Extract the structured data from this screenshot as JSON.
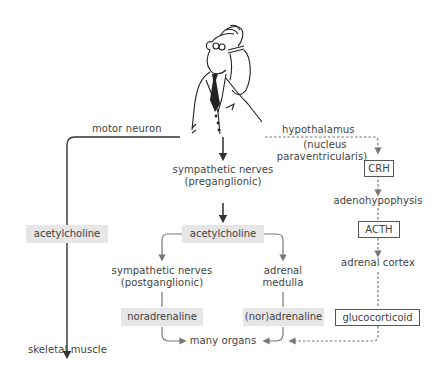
{
  "diagram": {
    "figure": "stressed-man-scratching-head-icon",
    "left_pathway": {
      "nerve_label": "motor neuron",
      "transmitter": "acetylcholine",
      "target": "skeletal muscle"
    },
    "middle_pathway": {
      "nerve_label_line1": "sympathetic nerves",
      "nerve_label_line2": "(preganglionic)",
      "transmitter": "acetylcholine",
      "branch_left": {
        "label_line1": "sympathetic nerves",
        "label_line2": "(postganglionic)",
        "transmitter": "noradrenaline"
      },
      "branch_right": {
        "label_line1": "adrenal",
        "label_line2": "medulla",
        "transmitter": "(nor)adrenaline"
      },
      "target": "many organs"
    },
    "right_pathway": {
      "origin_line1": "hypothalamus",
      "origin_line2": "(nucleus",
      "origin_line3": "paraventricularis)",
      "hormone1": "CRH",
      "gland1": "adenohypophysis",
      "hormone2": "ACTH",
      "gland2": "adrenal cortex",
      "hormone3": "glucocorticoid"
    },
    "colors": {
      "shaded_box": "#e6e6e6",
      "line_dark": "#333333",
      "line_grey": "#777777",
      "text": "#3f3f3f"
    }
  }
}
